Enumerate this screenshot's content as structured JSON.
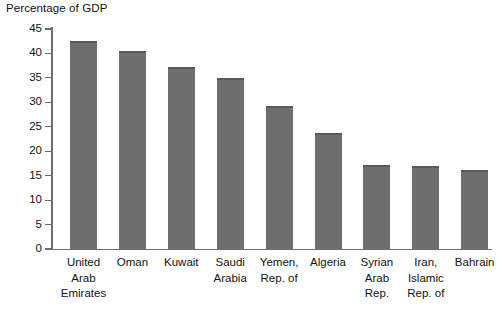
{
  "chart_data": {
    "type": "bar",
    "title": "Percentage of GDP",
    "xlabel": "",
    "ylabel": "",
    "ylim": [
      0,
      45
    ],
    "yticks": [
      0,
      5,
      10,
      15,
      20,
      25,
      30,
      35,
      40,
      45
    ],
    "grid": false,
    "legend": false,
    "bar_color": "#6e6e6e",
    "axis_color": "#6d6d6d",
    "categories": [
      "United Arab Emirates",
      "Oman",
      "Kuwait",
      "Saudi Arabia",
      "Yemen, Rep. of",
      "Algeria",
      "Syrian Arab Rep.",
      "Iran, Islamic Rep. of",
      "Bahrain"
    ],
    "category_lines": [
      [
        "United",
        "Arab",
        "Emirates"
      ],
      [
        "Oman"
      ],
      [
        "Kuwait"
      ],
      [
        "Saudi",
        "Arabia"
      ],
      [
        "Yemen,",
        "Rep. of"
      ],
      [
        "Algeria"
      ],
      [
        "Syrian",
        "Arab",
        "Rep."
      ],
      [
        "Iran,",
        "Islamic",
        "Rep. of"
      ],
      [
        "Bahrain"
      ]
    ],
    "values": [
      42.6,
      40.5,
      37.3,
      35.0,
      29.3,
      23.7,
      17.2,
      16.9,
      16.2
    ]
  }
}
